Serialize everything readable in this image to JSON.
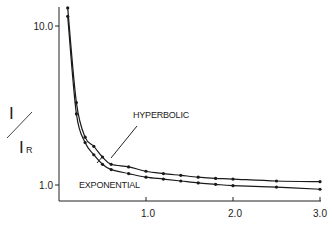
{
  "chart_data": {
    "type": "line",
    "title": "",
    "xlabel": "",
    "ylabel": "I / I_R",
    "ylabel_parts": {
      "numerator": "I",
      "denominator": "I",
      "subscript": "R"
    },
    "yscale": "log",
    "xlim": [
      0,
      3.0
    ],
    "ylim": [
      0.75,
      13
    ],
    "grid": false,
    "legend": "inline-annotations",
    "x_ticks": [
      {
        "value": 1.0,
        "label": "1.0"
      },
      {
        "value": 2.0,
        "label": "2.0"
      },
      {
        "value": 3.0,
        "label": "3.0"
      }
    ],
    "y_ticks": [
      {
        "value": 1.0,
        "label": "1.0"
      },
      {
        "value": 10.0,
        "label": "10.0"
      }
    ],
    "x": [
      0.1,
      0.2,
      0.3,
      0.4,
      0.5,
      0.6,
      0.8,
      1.0,
      1.2,
      1.4,
      1.6,
      1.8,
      2.0,
      2.5,
      3.0
    ],
    "series": [
      {
        "name": "HYPERBOLIC",
        "values": [
          13.0,
          3.3,
          2.0,
          1.75,
          1.5,
          1.35,
          1.3,
          1.22,
          1.18,
          1.15,
          1.12,
          1.1,
          1.09,
          1.06,
          1.05
        ]
      },
      {
        "name": "EXPONENTIAL",
        "values": [
          11.5,
          2.8,
          1.85,
          1.55,
          1.35,
          1.25,
          1.18,
          1.12,
          1.09,
          1.06,
          1.03,
          1.01,
          0.99,
          0.97,
          0.94
        ]
      }
    ],
    "annotations": [
      {
        "text": "HYPERBOLIC",
        "target_series": "HYPERBOLIC"
      },
      {
        "text": "EXPONENTIAL",
        "target_series": "EXPONENTIAL"
      }
    ]
  },
  "labels": {
    "y_numerator": "I",
    "y_denominator": "I",
    "y_subscript": "R",
    "hyperbolic": "HYPERBOLIC",
    "exponential": "EXPONENTIAL",
    "ytick_10": "10.0",
    "ytick_1": "1.0",
    "xtick_1": "1.0",
    "xtick_2": "2.0",
    "xtick_3": "3.0"
  },
  "colors": {
    "ink": "#1a1a1a",
    "background": "#ffffff"
  }
}
